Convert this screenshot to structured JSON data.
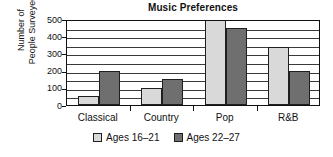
{
  "chart_data": {
    "type": "bar",
    "title": "Music Preferences",
    "xlabel": "",
    "ylabel": "Number of People Surveyed",
    "ylabel_lines": [
      "Number of",
      "People Surveyed"
    ],
    "categories": [
      "Classical",
      "Country",
      "Pop",
      "R&B"
    ],
    "series": [
      {
        "name": "Ages 16–21",
        "color": "#d9d9d9",
        "values": [
          50,
          100,
          500,
          340
        ]
      },
      {
        "name": "Ages 22–27",
        "color": "#6f6f6f",
        "values": [
          200,
          150,
          450,
          195
        ]
      }
    ],
    "ylim": [
      0,
      500
    ],
    "ytick_labels": [
      "0",
      "100",
      "200",
      "300",
      "400",
      "500"
    ],
    "ytick_values": [
      0,
      100,
      200,
      300,
      400,
      500
    ],
    "gridline_values": [
      50,
      100,
      150,
      200,
      250,
      300,
      350,
      400,
      450
    ],
    "grid": true,
    "legend_position": "bottom"
  },
  "legend": {
    "entries": [
      {
        "label": "Ages 16–21"
      },
      {
        "label": "Ages 22–27"
      }
    ]
  }
}
